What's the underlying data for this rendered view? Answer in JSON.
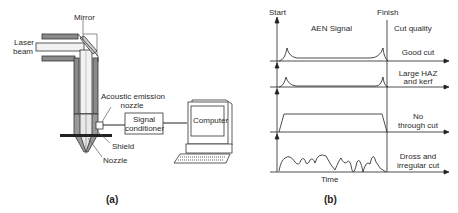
{
  "panel_a": {
    "caption": "(a)",
    "labels": {
      "mirror": "Mirror",
      "laser_beam_1": "Laser",
      "laser_beam_2": "beam",
      "ae_nozzle_1": "Acoustic emission",
      "ae_nozzle_2": "nozzle",
      "signal_conditioner_1": "Signal",
      "signal_conditioner_2": "conditioner",
      "computer": "Computer",
      "shield": "Shield",
      "nozzle": "Nozzle"
    }
  },
  "panel_b": {
    "caption": "(b)",
    "start": "Start",
    "finish": "Finish",
    "signal_title": "AEN Signal",
    "quality_title": "Cut quality",
    "x_label": "Time",
    "traces": [
      {
        "label_1": "Good cut",
        "label_2": ""
      },
      {
        "label_1": "Large HAZ",
        "label_2": "and kerf"
      },
      {
        "label_1": "No",
        "label_2": "through cut"
      },
      {
        "label_1": "Dross and",
        "label_2": "irregular cut"
      }
    ]
  }
}
